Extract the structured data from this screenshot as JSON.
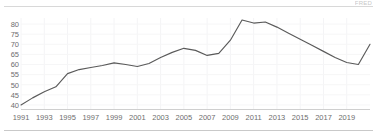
{
  "card": {
    "corner_note": "FRED",
    "background_color": "#ffffff",
    "border_color": "#d8d8d8"
  },
  "chart_data": {
    "type": "line",
    "title": "",
    "subtitle": "",
    "xlabel": "",
    "ylabel": "",
    "grid": true,
    "legend_position": "none",
    "line_color": "#5a5a5a",
    "axis_label_color": "#6e6e6e",
    "gridline_color": "#f4f4f6",
    "xlim": [
      1991,
      2021
    ],
    "ylim": [
      38,
      83
    ],
    "y_ticks": [
      40,
      45,
      50,
      55,
      60,
      65,
      70,
      75,
      80
    ],
    "x_ticks": [
      1991,
      1993,
      1995,
      1997,
      1999,
      2001,
      2003,
      2005,
      2007,
      2009,
      2011,
      2013,
      2015,
      2017,
      2019
    ],
    "x": [
      1991,
      1992,
      1993,
      1994,
      1995,
      1996,
      1997,
      1998,
      1999,
      2000,
      2001,
      2002,
      2003,
      2004,
      2005,
      2006,
      2007,
      2008,
      2009,
      2010,
      2011,
      2012,
      2013,
      2014,
      2015,
      2016,
      2017,
      2018,
      2019,
      2020,
      2021
    ],
    "values": [
      40.0,
      43.5,
      46.5,
      49.0,
      55.5,
      57.5,
      58.5,
      59.5,
      60.8,
      60.0,
      59.0,
      60.5,
      63.5,
      66.0,
      68.0,
      67.0,
      64.5,
      65.5,
      72.0,
      82.0,
      80.5,
      81.0,
      78.5,
      75.5,
      72.5,
      69.5,
      66.5,
      63.5,
      61.0,
      60.0,
      70.0
    ],
    "series": [
      {
        "name": "Series 1",
        "values": [
          40.0,
          43.5,
          46.5,
          49.0,
          55.5,
          57.5,
          58.5,
          59.5,
          60.8,
          60.0,
          59.0,
          60.5,
          63.5,
          66.0,
          68.0,
          67.0,
          64.5,
          65.5,
          72.0,
          82.0,
          80.5,
          81.0,
          78.5,
          75.5,
          72.5,
          69.5,
          66.5,
          63.5,
          61.0,
          60.0,
          70.0
        ]
      }
    ]
  }
}
